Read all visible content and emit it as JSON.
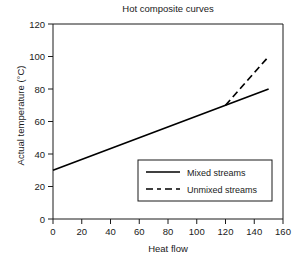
{
  "chart_data": {
    "type": "line",
    "title": "Hot composite curves",
    "xlabel": "Heat flow",
    "ylabel": "Actual temperature (°C)",
    "xlim": [
      0,
      160
    ],
    "ylim": [
      0,
      120
    ],
    "xticks": [
      0,
      20,
      40,
      60,
      80,
      100,
      120,
      140,
      160
    ],
    "yticks": [
      0,
      20,
      40,
      60,
      80,
      100,
      120
    ],
    "grid": false,
    "legend_position": "lower right inside axes",
    "series": [
      {
        "name": "Mixed streams",
        "style": "solid",
        "color": "#000000",
        "points": [
          [
            0,
            30
          ],
          [
            120,
            70
          ],
          [
            150,
            80
          ]
        ]
      },
      {
        "name": "Unmixed streams",
        "style": "dashed",
        "color": "#000000",
        "points": [
          [
            120,
            70
          ],
          [
            150,
            100
          ]
        ]
      }
    ],
    "annotations": []
  },
  "legend": {
    "entries": [
      {
        "label": "Mixed streams"
      },
      {
        "label": "Unmixed streams"
      }
    ]
  },
  "axis": {
    "x_tick_labels": [
      "0",
      "20",
      "40",
      "60",
      "80",
      "100",
      "120",
      "140",
      "160"
    ],
    "y_tick_labels": [
      "0",
      "20",
      "40",
      "60",
      "80",
      "100",
      "120"
    ]
  }
}
